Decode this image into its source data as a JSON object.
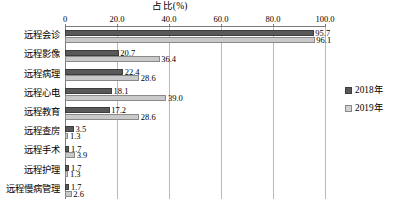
{
  "chart_data": {
    "type": "bar",
    "orientation": "horizontal",
    "title": "占比(%)",
    "xlabel": "",
    "ylabel": "",
    "xlim": [
      0,
      100
    ],
    "xticks": [
      "0",
      "20.0",
      "40.0",
      "60.0",
      "80.0",
      "100.0"
    ],
    "xtick_values": [
      0,
      20,
      40,
      60,
      80,
      100
    ],
    "grid": true,
    "grid_axis": "x",
    "legend_position": "right",
    "categories": [
      "远程会诊",
      "远程影像",
      "远程病理",
      "远程心电",
      "远程教育",
      "远程查房",
      "远程手术",
      "远程护理",
      "远程慢病管理"
    ],
    "series": [
      {
        "name": "2018年",
        "color": "#595959",
        "values": [
          95.7,
          20.7,
          22.4,
          18.1,
          17.2,
          3.5,
          1.7,
          1.7,
          1.7
        ],
        "labels": [
          "95.7",
          "20.7",
          "22.4",
          "18.1",
          "17.2",
          "3.5",
          "1.7",
          "1.7",
          "1.7"
        ]
      },
      {
        "name": "2019年",
        "color": "#c9c9c9",
        "values": [
          96.1,
          36.4,
          28.6,
          39.0,
          28.6,
          1.3,
          3.9,
          1.3,
          2.6
        ],
        "labels": [
          "96.1",
          "36.4",
          "28.6",
          "39.0",
          "28.6",
          "1.3",
          "3.9",
          "1.3",
          "2.6"
        ]
      }
    ]
  },
  "legend": {
    "items": [
      {
        "label": "2018年"
      },
      {
        "label": "2019年"
      }
    ]
  },
  "caption": {
    "text": ""
  }
}
